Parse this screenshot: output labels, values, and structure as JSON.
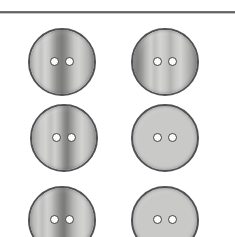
{
  "page": {
    "background_color": "#ffffff",
    "width": 235,
    "height": 237
  },
  "divider": {
    "name": "horizontal-rule",
    "color": "#55575b",
    "y": 11,
    "thickness": 2
  },
  "palette": {
    "outline": "#4f5154",
    "hole_fill": "#fcfcfb",
    "hole_rim": "#3f4145",
    "base_light": "#d2d2d0",
    "base_mid": "#b4b4b2",
    "base_dark": "#8e8e8c",
    "base_darkest": "#6f6f6e"
  },
  "buttons": [
    {
      "id": "button-1",
      "label": "Striped two-hole button, row 1 column 1",
      "row": 1,
      "column": 1,
      "x": 28,
      "y": 28,
      "diameter": 68,
      "holes": 2,
      "shape": "round",
      "stripe_style": "center-dark-band",
      "gradient": "linear-gradient(90deg, #9d9d9b 0%, #b9b9b7 7%, #cfcfcd 13%, #c2c2c0 19%, #d4d4d2 25%, #c8c8c6 31%, #a9a9a7 37%, #8b8b89 43%, #7c7c7b 50%, #8f8f8d 56%, #adadab 62%, #c6c6c4 68%, #d2d2d0 75%, #c3c3c1 82%, #b0b0ae 89%, #969694 95%, #848482 100%)"
    },
    {
      "id": "button-2",
      "label": "Striped two-hole button, row 1 column 2",
      "row": 1,
      "column": 2,
      "x": 131,
      "y": 28,
      "diameter": 68,
      "holes": 2,
      "shape": "round",
      "stripe_style": "dark-left-edge",
      "gradient": "linear-gradient(90deg, #878785 0%, #7c7c7a 9%, #989896 16%, #b8b8b6 22%, #d0d0ce 29%, #c0c0be 35%, #d4d4d2 43%, #c7c7c5 51%, #b3b3b1 58%, #cacac8 66%, #d3d3d1 73%, #bdbdbb 81%, #a5a5a3 89%, #8d8d8b 96%, #7f7f7d 100%)"
    },
    {
      "id": "button-3",
      "label": "Striped two-hole button, row 2 column 1",
      "row": 2,
      "column": 1,
      "x": 30,
      "y": 104,
      "diameter": 68,
      "holes": 2,
      "shape": "round",
      "stripe_style": "center-dark-band",
      "gradient": "linear-gradient(90deg, #909090 0%, #b0b0ae 8%, #c9c9c7 15%, #d3d3d1 23%, #c1c1bf 30%, #d0d0ce 37%, #b5b5b3 44%, #8f8f8d 50%, #7e7e7c 55%, #9a9a98 61%, #bcbcba 68%, #d2d2d0 76%, #c4c4c2 84%, #aeaeac 92%, #8c8c8a 100%)"
    },
    {
      "id": "button-4",
      "label": "Striped two-hole button, row 2 column 2",
      "row": 2,
      "column": 2,
      "x": 131,
      "y": 104,
      "diameter": 68,
      "holes": 2,
      "shape": "round",
      "stripe_style": "left-dark-band",
      "gradient": "linear-gradient(90deg, #8d8d8b 0%, #a8a8a6 6%, #c4c4c2 12%, #b2b2b0 18%, #7b7b79 24%, #6f6f6e 31%, #8e8e8c 37%, #b6b6b4 44%, #d2d2d0 52%, #c9c9c7 60%, #d3d3d1 68%, #c2c2c0 77%, #abab a9 86%, #909090 94%, #808080 100%)"
    },
    {
      "id": "button-5",
      "label": "Striped two-hole button, row 3 column 1 (cropped)",
      "row": 3,
      "column": 1,
      "x": 28,
      "y": 186,
      "diameter": 68,
      "holes": 2,
      "shape": "round",
      "stripe_style": "center-dark-band",
      "gradient": "linear-gradient(90deg, #949492 0%, #b6b6b4 8%, #cdcdcb 15%, #bebebc 21%, #d2d2d0 28%, #c5c5c3 34%, #a4a4a2 41%, #868684 48%, #7a7a78 53%, #949492 59%, #b4b4b2 66%, #cbcbc9 74%, #d2d2d0 82%, #bfbfbd 90%, #9a9a98 100%)"
    },
    {
      "id": "button-6",
      "label": "Striped two-hole button, row 3 column 2 (cropped)",
      "row": 3,
      "column": 2,
      "x": 131,
      "y": 186,
      "diameter": 68,
      "holes": 2,
      "shape": "round",
      "stripe_style": "dual-dark-band",
      "gradient": "linear-gradient(90deg, #8a8a88 0%, #a5a5a3 7%, #c2c2c0 13%, #b0b0ae 20%, #7d7d7b 26%, #74747 2 33%, #9a9a98 40%, #bebebc 48%, #d1d1cf 56%, #c6c6c4 64%, #d0d0ce 72%, #bababa 80%, #a0a0 9e 89%, #8a8a88 100%)"
    }
  ]
}
